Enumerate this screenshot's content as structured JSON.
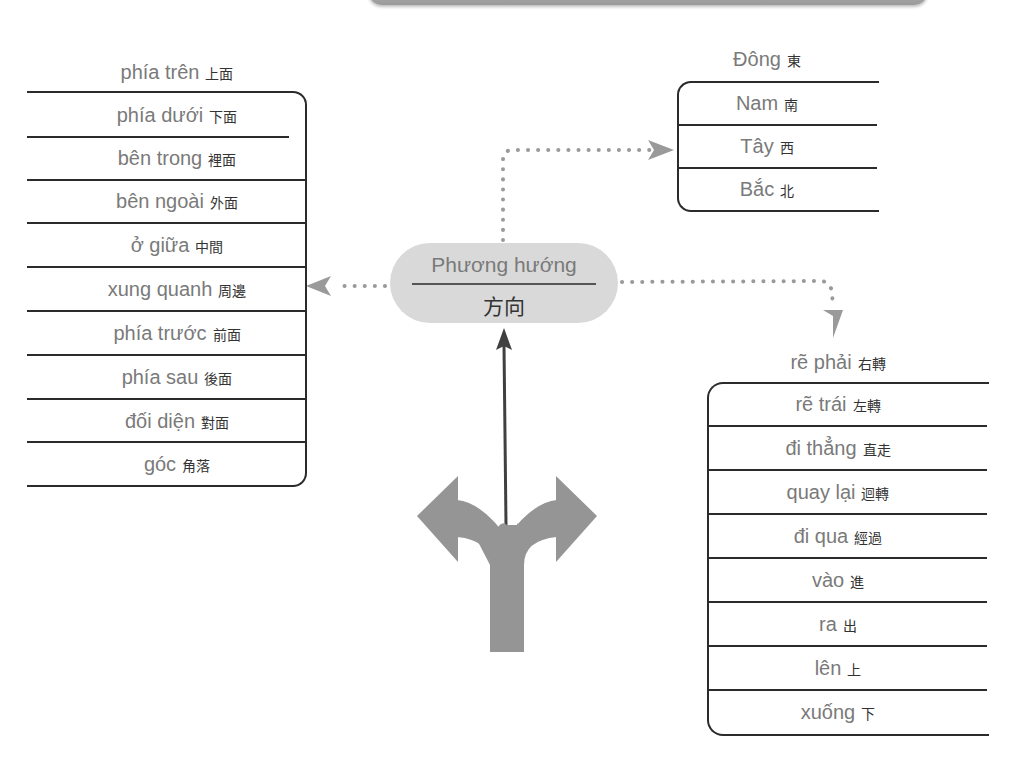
{
  "center": {
    "title_vi": "Phương hướng",
    "title_zh": "方向"
  },
  "left_list": {
    "header": {
      "vi": "phía trên",
      "zh": "上面"
    },
    "items": [
      {
        "vi": "phía dưới",
        "zh": "下面"
      },
      {
        "vi": "bên trong",
        "zh": "裡面"
      },
      {
        "vi": "bên ngoài",
        "zh": "外面"
      },
      {
        "vi": "ở giữa",
        "zh": "中間"
      },
      {
        "vi": "xung quanh",
        "zh": "周邊"
      },
      {
        "vi": "phía trước",
        "zh": "前面"
      },
      {
        "vi": "phía sau",
        "zh": "後面"
      },
      {
        "vi": "đối diện",
        "zh": "對面"
      },
      {
        "vi": "góc",
        "zh": "角落"
      }
    ]
  },
  "top_right_list": {
    "header": {
      "vi": "Đông",
      "zh": "東"
    },
    "items": [
      {
        "vi": "Nam",
        "zh": "南"
      },
      {
        "vi": "Tây",
        "zh": "西"
      },
      {
        "vi": "Bắc",
        "zh": "北"
      }
    ]
  },
  "bottom_right_list": {
    "header": {
      "vi": "rẽ phải",
      "zh": "右轉"
    },
    "items": [
      {
        "vi": "rẽ trái",
        "zh": "左轉"
      },
      {
        "vi": "đi thẳng",
        "zh": "直走"
      },
      {
        "vi": "quay lại",
        "zh": "迴轉"
      },
      {
        "vi": "đi qua",
        "zh": "經過"
      },
      {
        "vi": "vào",
        "zh": "進"
      },
      {
        "vi": "ra",
        "zh": "出"
      },
      {
        "vi": "lên",
        "zh": "上"
      },
      {
        "vi": "xuống",
        "zh": "下"
      }
    ]
  },
  "colors": {
    "connector": "#9a9a9a",
    "pill": "#d9d9d9",
    "text": "#7a7a7a",
    "line": "#2b2b2b",
    "fork_arrow": "#959595"
  }
}
